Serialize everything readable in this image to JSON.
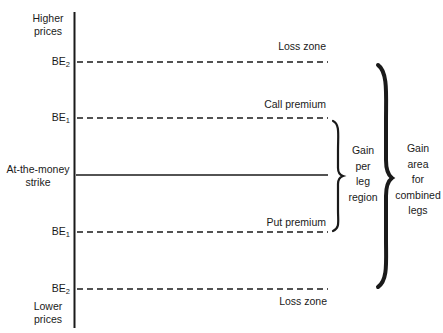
{
  "diagram": {
    "axis": {
      "top_label": "Higher prices",
      "top_label_lines": [
        "Higher",
        "prices"
      ],
      "bottom_label": "Lower prices",
      "bottom_label_lines": [
        "Lower",
        "prices"
      ]
    },
    "levels": [
      {
        "id": "be2-upper",
        "label": "BE",
        "subscript": "2",
        "line": "dashed",
        "zone_label": "Loss zone",
        "zone_label_position": "above"
      },
      {
        "id": "be1-upper",
        "label": "BE",
        "subscript": "1",
        "line": "dashed",
        "zone_label": "Call premium",
        "zone_label_position": "above"
      },
      {
        "id": "atm-strike",
        "label": "At-the-money strike",
        "label_lines": [
          "At-the-money",
          "strike"
        ],
        "line": "solid"
      },
      {
        "id": "be1-lower",
        "label": "BE",
        "subscript": "1",
        "line": "dashed",
        "zone_label": "Put premium",
        "zone_label_position": "above"
      },
      {
        "id": "be2-lower",
        "label": "BE",
        "subscript": "2",
        "line": "dashed",
        "zone_label": "Loss zone",
        "zone_label_position": "below"
      }
    ],
    "braces": [
      {
        "id": "gain-per-leg",
        "spans": [
          "be1-upper",
          "be1-lower"
        ],
        "label": "Gain per leg region",
        "label_lines": [
          "Gain",
          "per",
          "leg",
          "region"
        ]
      },
      {
        "id": "gain-combined",
        "spans": [
          "be2-upper",
          "be2-lower"
        ],
        "label": "Gain area for combined legs",
        "label_lines": [
          "Gain",
          "area",
          "for",
          "combined",
          "legs"
        ]
      }
    ],
    "colors": {
      "ink": "#1a1a1a",
      "background": "#ffffff"
    }
  }
}
